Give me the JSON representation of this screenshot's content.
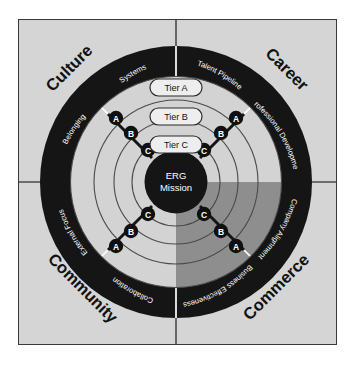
{
  "diagram": {
    "title_center": "ERG\nMission",
    "center_line1": "ERG",
    "center_line2": "Mission",
    "colors": {
      "background": "#d5d5d5",
      "ring_dark": "#151515",
      "band_light": "#d3d3d3",
      "band_shaded": "#8e8e8e",
      "frame": "#3a3a3a",
      "node": "#101010",
      "text_light": "#ffffff",
      "text_dark": "#111111"
    },
    "quadrants": [
      {
        "name": "Culture",
        "position": "top-left",
        "sub_labels": [
          "Systems",
          "Belonging"
        ],
        "nodes": [
          "A",
          "B",
          "C"
        ],
        "shaded": false
      },
      {
        "name": "Career",
        "position": "top-right",
        "sub_labels": [
          "Talent Pipeline",
          "Professional Development"
        ],
        "nodes": [
          "A",
          "B",
          "C"
        ],
        "shaded": false
      },
      {
        "name": "Community",
        "position": "bottom-left",
        "sub_labels": [
          "External Focus",
          "Collaboration"
        ],
        "nodes": [
          "A",
          "B",
          "C"
        ],
        "shaded": false
      },
      {
        "name": "Commerce",
        "position": "bottom-right",
        "sub_labels": [
          "Business Effectiveness",
          "Company Alignment"
        ],
        "nodes": [
          "A",
          "B",
          "C"
        ],
        "shaded": true
      }
    ],
    "tiers": [
      {
        "label": "Tier A"
      },
      {
        "label": "Tier B"
      },
      {
        "label": "Tier C"
      }
    ],
    "node_labels": {
      "a": "A",
      "b": "B",
      "c": "C"
    }
  }
}
